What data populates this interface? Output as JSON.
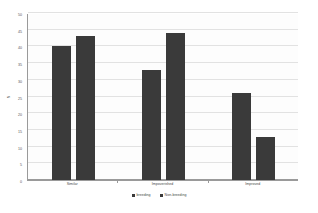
{
  "chart_data": {
    "type": "bar",
    "title": "",
    "xlabel": "",
    "ylabel": "N",
    "categories": [
      "Similar",
      "Impoverished",
      "Improved"
    ],
    "series": [
      {
        "name": "breeding",
        "color": "#3a3a3a",
        "values": [
          40,
          33,
          26
        ]
      },
      {
        "name": "Non-breeding",
        "color": "#3a3a3a",
        "values": [
          43,
          44,
          13
        ]
      }
    ],
    "ylim": [
      0,
      50
    ],
    "y_ticks": [
      0,
      5,
      10,
      15,
      20,
      25,
      30,
      35,
      40,
      45,
      50
    ],
    "y_tick_labels": [
      "0",
      "5",
      "10",
      "15",
      "20",
      "25",
      "30",
      "35",
      "40",
      "45",
      "50"
    ],
    "grid": true,
    "legend_position": "bottom"
  }
}
